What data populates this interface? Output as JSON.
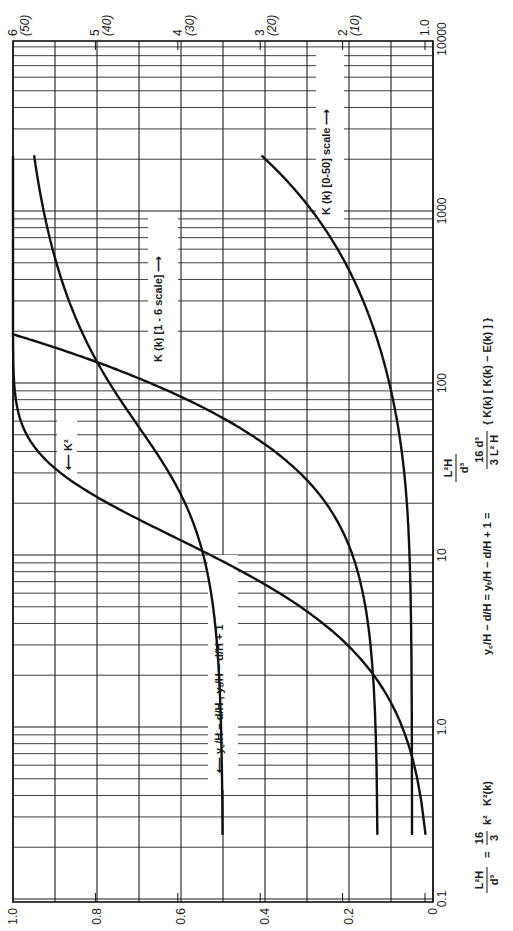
{
  "chart_data": {
    "type": "line",
    "orientation": "rotated-90-ccw",
    "title": "",
    "xlabel": "L²H / d³",
    "x_scale": "log",
    "x_range": [
      0.1,
      10000
    ],
    "x_ticks": [
      "0.1",
      "1.0",
      "10",
      "100",
      "1000",
      "10000"
    ],
    "ylabel_left": "ratio (0–1)",
    "y_range": [
      0,
      1.0
    ],
    "y_ticks": [
      "0",
      "0.2",
      "0.4",
      "0.6",
      "0.8",
      "1.0"
    ],
    "secondary_scale_1_6": {
      "label": "K(k) [1-6 scale]",
      "range": [
        1,
        6
      ],
      "ticks": [
        "1.0",
        "2",
        "3",
        "4",
        "5",
        "6"
      ]
    },
    "secondary_scale_0_50": {
      "label": "K(k) [0-50] scale",
      "range": [
        0,
        50
      ],
      "ticks": [
        "(10)",
        "(20)",
        "(30)",
        "(40)",
        "(50)"
      ]
    },
    "grid": true,
    "series": [
      {
        "name": "K²",
        "axis": "left (0-1)",
        "points": [
          [
            0.107,
            0.02
          ],
          [
            0.27,
            0.05
          ],
          [
            0.55,
            0.1
          ],
          [
            1.39,
            0.1
          ],
          [
            4.7,
            0.3
          ],
          [
            9.17,
            0.5
          ],
          [
            16.1,
            0.7
          ],
          [
            31.9,
            0.9
          ],
          [
            72.1,
            0.99
          ],
          [
            125,
            0.999
          ],
          [
            191,
            0.9999
          ],
          [
            10000,
            1.0
          ]
        ]
      },
      {
        "name": "yc/H − d/H = yt/H − d/H + 1",
        "axis": "left (0-1)",
        "points": [
          [
            0.107,
            0.5
          ],
          [
            1.39,
            0.506
          ],
          [
            4.7,
            0.522
          ],
          [
            9.17,
            0.543
          ],
          [
            16.1,
            0.574
          ],
          [
            31.9,
            0.635
          ],
          [
            72.1,
            0.733
          ],
          [
            125,
            0.794
          ],
          [
            191,
            0.833
          ],
          [
            1000,
            0.9
          ],
          [
            10000,
            0.977
          ]
        ]
      },
      {
        "name": "K(k) [1-6 scale]",
        "axis": "1-6 scale",
        "points": [
          [
            0.107,
            1.578
          ],
          [
            1.39,
            1.612
          ],
          [
            4.7,
            1.714
          ],
          [
            9.17,
            1.854
          ],
          [
            16.1,
            2.075
          ],
          [
            31.9,
            2.578
          ],
          [
            72.1,
            3.696
          ],
          [
            125,
            4.841
          ],
          [
            191,
            5.992
          ]
        ]
      },
      {
        "name": "K(k) [0-50] scale",
        "axis": "0-50 scale",
        "points": [
          [
            0.107,
            1.578
          ],
          [
            9.17,
            1.854
          ],
          [
            72.1,
            3.696
          ],
          [
            191,
            5.992
          ],
          [
            1000,
            13.7
          ],
          [
            3000,
            23.7
          ],
          [
            10000,
            43.3
          ]
        ]
      }
    ],
    "annotations": [
      "← K²",
      "← yc/H − d/H ,  yt/H − d/H + 1",
      "K (k) [1-6 scale] →",
      "K (k) [0-50] scale →",
      "L²H/d³ = 16/3 k² K²(k)",
      "yc/H − d/H = yt/H − d/H + 1 = 16d³/(3L²H) { K(k) [ K(k) − E(k) ] }"
    ]
  },
  "labels": {
    "x_axis_title_num": "L²H",
    "x_axis_title_den": "d³",
    "eq1_lhs_num": "L²H",
    "eq1_lhs_den": "d³",
    "eq1_eq": "=",
    "eq1_coef_num": "16",
    "eq1_coef_den": "3",
    "eq1_rest": "k²   K²(k)",
    "eq2": "y꜀/H − d/H = yₜ/H − d/H + 1 =",
    "eq2_coef_num": "16 d³",
    "eq2_coef_den": "3 L² H",
    "eq2_rest": "{ K(k) [ K(k) − E(k) ] }",
    "k2_label": "⟵ K²",
    "yc_label": "⟵  y꜀/H − d/H ,  yₜ/H − d/H + 1",
    "k16_label": "K (k) [1 - 6 scale] ⟶",
    "k050_label": "K (k) [0-50] scale ⟶"
  }
}
